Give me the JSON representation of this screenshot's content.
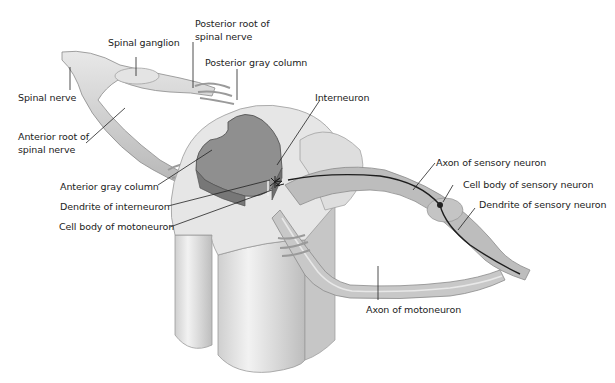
{
  "diagram": {
    "labels": {
      "spinal_nerve": "Spinal nerve",
      "spinal_ganglion": "Spinal ganglion",
      "posterior_root_line1": "Posterior root of",
      "posterior_root_line2": "spinal nerve",
      "posterior_gray_column": "Posterior gray column",
      "interneuron": "Interneuron",
      "anterior_root_line1": "Anterior root of",
      "anterior_root_line2": "spinal nerve",
      "anterior_gray_column": "Anterior gray column",
      "dendrite_of_interneuron": "Dendrite of interneuron",
      "cell_body_of_motoneuron": "Cell body of motoneuron",
      "axon_of_sensory_neuron": "Axon of sensory neuron",
      "cell_body_of_sensory_neuron": "Cell body of sensory neuron",
      "dendrite_of_sensory_neuron": "Dendrite of sensory neuron",
      "axon_of_motoneuron": "Axon of motoneuron"
    },
    "colors": {
      "white_matter": "#e6e6e6",
      "white_matter_shade": "#c9c9c9",
      "gray_matter": "#8f8f8f",
      "gray_matter_side": "#6f6f6f",
      "nerve": "#bdbdbd",
      "nerve_light": "#dcdcdc",
      "neuron_line": "#1e1e1e"
    }
  }
}
